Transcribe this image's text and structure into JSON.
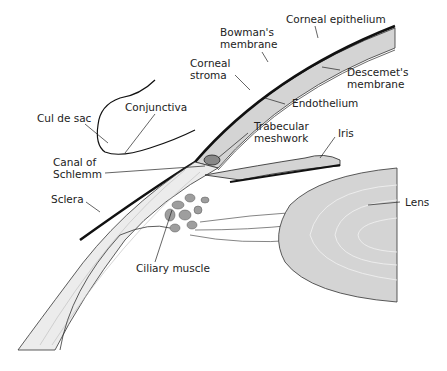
{
  "diagram": {
    "labels": {
      "corneal_epithelium": "Corneal epithelium",
      "bowmans_membrane": [
        "Bowman's",
        "membrane"
      ],
      "corneal_stroma": [
        "Corneal",
        "stroma"
      ],
      "descemets_membrane": [
        "Descemet's",
        "membrane"
      ],
      "endothelium": "Endothelium",
      "cul_de_sac": "Cul de sac",
      "conjunctiva": "Conjunctiva",
      "trabecular_meshwork": [
        "Trabecular",
        "meshwork"
      ],
      "iris": "Iris",
      "canal_of_schlemm": [
        "Canal of",
        "Schlemm"
      ],
      "sclera": "Sclera",
      "lens": "Lens",
      "ciliary_muscle": "Ciliary muscle"
    },
    "colors": {
      "tissue_fill": "#d4d4d4",
      "muscle_fill": "#9e9e9e",
      "outline": "#222222",
      "epithelium": "#111111",
      "background": "#ffffff"
    }
  }
}
